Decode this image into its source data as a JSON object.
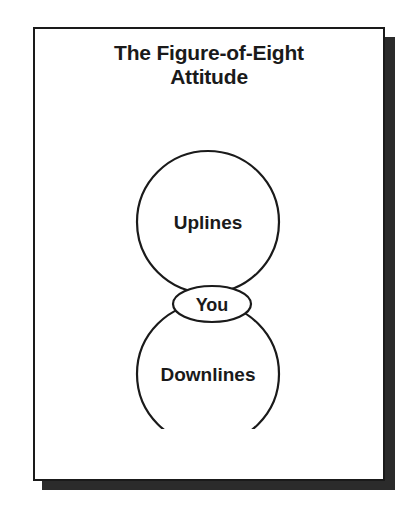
{
  "page": {
    "title": "The Figure-of-Eight\nAttitude",
    "title_line_1": "The Figure-of-Eight",
    "title_line_2": "Attitude",
    "background_color": "#ffffff",
    "ink_color": "#1a1a1a",
    "shadow_color": "#2b2b2b"
  },
  "diagram": {
    "type": "figure-of-eight",
    "nodes": [
      {
        "id": "uplines",
        "label": "Uplines",
        "shape": "circle",
        "position": "top"
      },
      {
        "id": "you",
        "label": "You",
        "shape": "ellipse",
        "position": "middle"
      },
      {
        "id": "downlines",
        "label": "Downlines",
        "shape": "circle",
        "position": "bottom"
      }
    ]
  }
}
